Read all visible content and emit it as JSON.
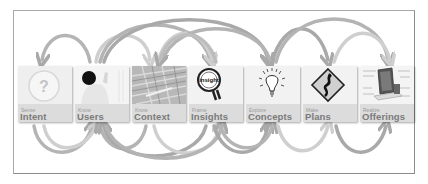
{
  "diagram": {
    "title": "",
    "colors": {
      "frame": "#a8a8a8",
      "card_bg": "#ececec",
      "card_band": "#dcdcdc",
      "label": "#7a7a7a",
      "sublabel": "#9a9a9a",
      "arrow_dark": "#a9a9a9",
      "arrow_light": "#cfcfcf"
    },
    "steps": [
      {
        "sub": "Sense",
        "label": "Intent",
        "icon": "question-mark-icon"
      },
      {
        "sub": "Know",
        "label": "Users",
        "icon": "person-photo-icon"
      },
      {
        "sub": "Know",
        "label": "Context",
        "icon": "city-aerial-photo-icon"
      },
      {
        "sub": "Frame",
        "label": "Insights",
        "icon": "magnifying-glass-insight-icon"
      },
      {
        "sub": "Explore",
        "label": "Concepts",
        "icon": "light-bulb-icon"
      },
      {
        "sub": "Make",
        "label": "Plans",
        "icon": "winding-road-sign-icon"
      },
      {
        "sub": "Realize",
        "label": "Offerings",
        "icon": "device-diagram-icon"
      }
    ]
  }
}
